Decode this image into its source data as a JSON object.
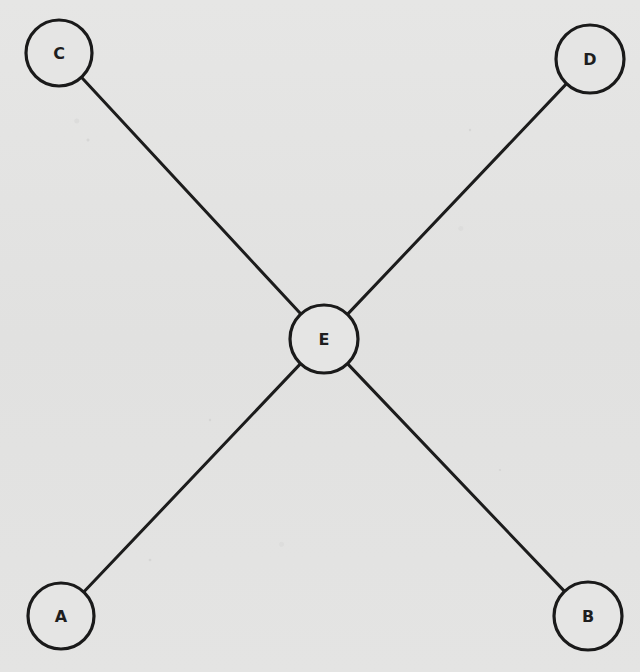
{
  "diagram": {
    "type": "star-graph",
    "colors": {
      "paper": "#e3e3e2",
      "ink": "#1a1a1a"
    },
    "nodes": [
      {
        "id": "A",
        "label": "A",
        "cx": 61,
        "cy": 616,
        "r": 33
      },
      {
        "id": "B",
        "label": "B",
        "cx": 588,
        "cy": 616,
        "r": 34
      },
      {
        "id": "C",
        "label": "C",
        "cx": 59,
        "cy": 53,
        "r": 33
      },
      {
        "id": "D",
        "label": "D",
        "cx": 590,
        "cy": 59,
        "r": 34
      },
      {
        "id": "E",
        "label": "E",
        "cx": 324,
        "cy": 339,
        "r": 34
      }
    ],
    "edges": [
      {
        "from": "C",
        "to": "E"
      },
      {
        "from": "D",
        "to": "E"
      },
      {
        "from": "A",
        "to": "E"
      },
      {
        "from": "B",
        "to": "E"
      }
    ]
  }
}
